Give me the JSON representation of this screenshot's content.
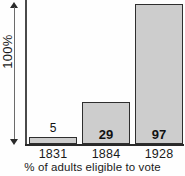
{
  "chart_data": {
    "type": "bar",
    "title": "",
    "xlabel": "% of adults eligible to vote",
    "ylabel": "100%",
    "categories": [
      "1831",
      "1884",
      "1928"
    ],
    "values": [
      5,
      29,
      97
    ],
    "ylim": [
      0,
      100
    ],
    "grid": false,
    "legend": null,
    "annotations": {
      "y_scale_marker": "100%",
      "value_labels": [
        "5",
        "29",
        "97"
      ]
    },
    "colors": {
      "bar_fill": "#cdcdcd",
      "bar_stroke": "#2e2e2e",
      "axis": "#2a2a2a",
      "text": "#1a1a1a",
      "background": "#fefefe"
    }
  },
  "axis": {
    "y_scale_label": "100%",
    "x_caption": "% of adults eligible to vote"
  },
  "bars": [
    {
      "category": "1831",
      "value": 5,
      "value_label": "5",
      "label_position": "above"
    },
    {
      "category": "1884",
      "value": 29,
      "value_label": "29",
      "label_position": "inside"
    },
    {
      "category": "1928",
      "value": 97,
      "value_label": "97",
      "label_position": "inside"
    }
  ]
}
